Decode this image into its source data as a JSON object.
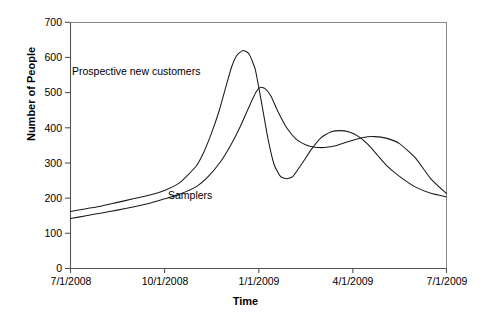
{
  "chart_data": {
    "type": "line",
    "title": "",
    "subtitle": "",
    "xlabel": "Time",
    "ylabel": "Number of People",
    "grid": false,
    "legend_position": "inline-annotations",
    "xlim": [
      0,
      12
    ],
    "ylim": [
      0,
      700
    ],
    "x_tick_labels": [
      "7/1/2008",
      "10/1/2008",
      "1/1/2009",
      "4/1/2009",
      "7/1/2009"
    ],
    "x_tick_values": [
      0,
      3,
      6,
      9,
      12
    ],
    "y_tick_labels": [
      "0",
      "100",
      "200",
      "300",
      "400",
      "500",
      "600",
      "700"
    ],
    "y_tick_values": [
      0,
      100,
      200,
      300,
      400,
      500,
      600,
      700
    ],
    "x_unit": "months since 7/1/2008",
    "series": [
      {
        "name": "Prospective new customers",
        "color": "#1a1a1a",
        "annotation_label": "Prospective new customers",
        "x": [
          0,
          0.5,
          1,
          1.5,
          2,
          2.5,
          3,
          3.5,
          4,
          4.25,
          4.5,
          4.75,
          5,
          5.15,
          5.3,
          5.5,
          5.7,
          5.9,
          6.1,
          6.3,
          6.5,
          6.7,
          6.9,
          7.1,
          7.4,
          7.7,
          8,
          8.3,
          8.6,
          8.9,
          9.2,
          9.5,
          9.8,
          10.1,
          10.5,
          11,
          11.5,
          12
        ],
        "y": [
          162,
          170,
          178,
          188,
          198,
          208,
          222,
          245,
          290,
          330,
          385,
          450,
          530,
          575,
          605,
          620,
          610,
          565,
          470,
          370,
          295,
          262,
          255,
          262,
          300,
          340,
          372,
          388,
          392,
          388,
          375,
          352,
          322,
          292,
          262,
          232,
          214,
          204
        ]
      },
      {
        "name": "Samplers",
        "color": "#1a1a1a",
        "annotation_label": "Samplers",
        "x": [
          0,
          0.5,
          1,
          1.5,
          2,
          2.5,
          3,
          3.5,
          4,
          4.4,
          4.8,
          5.1,
          5.4,
          5.7,
          5.9,
          6.05,
          6.2,
          6.4,
          6.6,
          6.9,
          7.2,
          7.5,
          7.8,
          8.1,
          8.5,
          8.9,
          9.3,
          9.7,
          10.1,
          10.5,
          11,
          11.5,
          12
        ],
        "y": [
          142,
          150,
          158,
          166,
          175,
          185,
          198,
          212,
          232,
          262,
          305,
          348,
          400,
          460,
          498,
          515,
          512,
          490,
          450,
          400,
          368,
          352,
          345,
          344,
          350,
          362,
          372,
          375,
          370,
          355,
          315,
          255,
          213
        ]
      }
    ]
  },
  "annotations": {
    "prospective_label": "Prospective new customers",
    "samplers_label": "Samplers"
  }
}
